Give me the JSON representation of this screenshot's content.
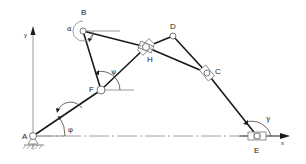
{
  "diagram": {
    "type": "planar linkage mechanism",
    "axes": {
      "x_label": "x",
      "y_label": "y"
    },
    "points": [
      {
        "id": "A",
        "label": "A",
        "x": 33,
        "y": 136
      },
      {
        "id": "F",
        "label": "F",
        "x": 101,
        "y": 90
      },
      {
        "id": "B",
        "label": "B",
        "x": 83,
        "y": 31
      },
      {
        "id": "H",
        "label": "H",
        "x": 146,
        "y": 47
      },
      {
        "id": "D",
        "label": "D",
        "x": 173,
        "y": 36
      },
      {
        "id": "C",
        "label": "C",
        "x": 207,
        "y": 73
      },
      {
        "id": "E",
        "label": "E",
        "x": 257,
        "y": 136
      }
    ],
    "links": [
      {
        "from": "A",
        "to": "F"
      },
      {
        "from": "F",
        "to": "H"
      },
      {
        "from": "F",
        "to": "B"
      },
      {
        "from": "B",
        "to": "H"
      },
      {
        "from": "H",
        "to": "D"
      },
      {
        "from": "D",
        "to": "C"
      },
      {
        "from": "H",
        "to": "C"
      },
      {
        "from": "C",
        "to": "E"
      }
    ],
    "angles": {
      "phi": "φ",
      "psi": "ψ",
      "alpha": "α",
      "gamma": "γ"
    },
    "labels": {
      "A": "A",
      "B": "B",
      "C": "C",
      "D": "D",
      "E": "E",
      "F": "F",
      "H": "H"
    }
  }
}
